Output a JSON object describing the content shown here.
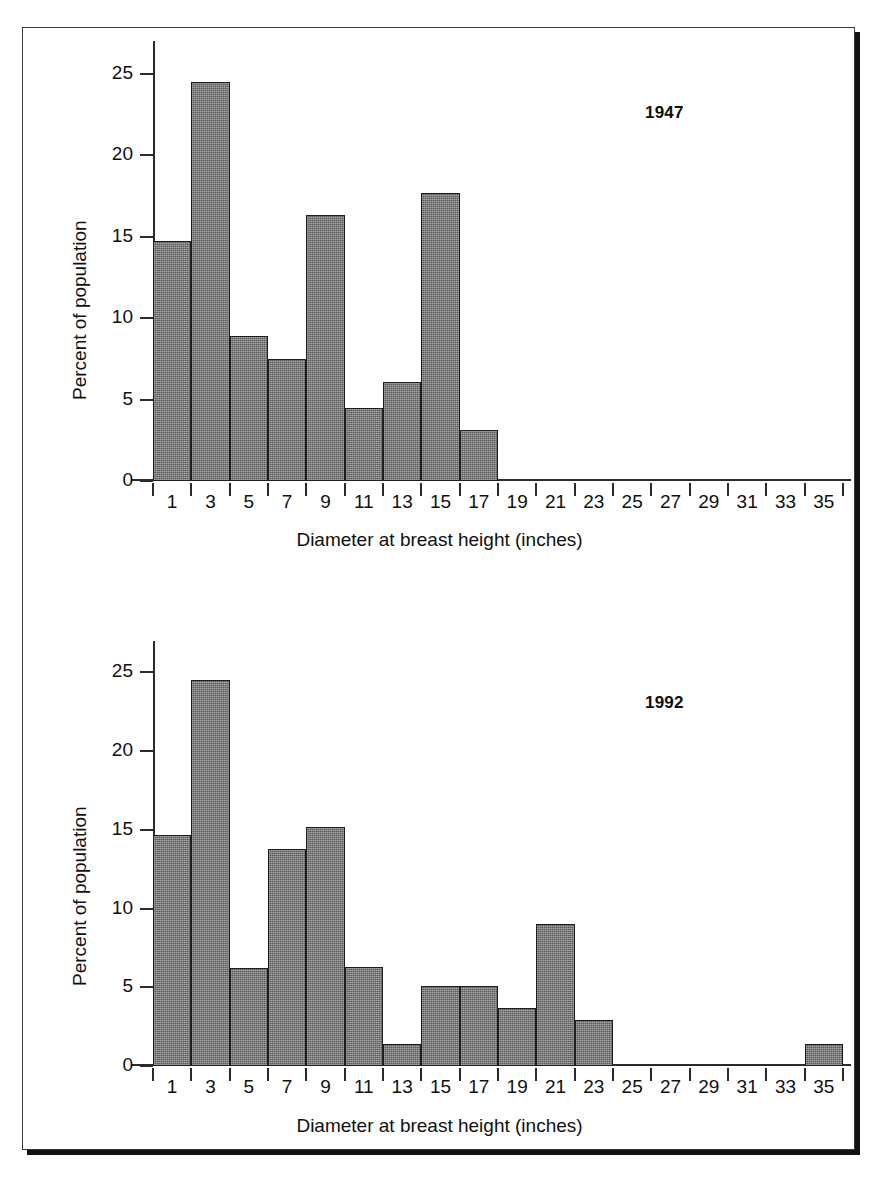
{
  "figure": {
    "x_axis_title": "Diameter at breast height (inches)",
    "y_axis_title": "Percent of population",
    "accent_color": "#6e6e6e",
    "outline_color": "#1d1d1d"
  },
  "panels": [
    {
      "id": "1947",
      "year_label": "1947"
    },
    {
      "id": "1992",
      "year_label": "1992"
    }
  ],
  "chart_data": [
    {
      "type": "bar",
      "title": "1947",
      "xlabel": "Diameter at breast height (inches)",
      "ylabel": "Percent of population",
      "xlim": [
        0,
        36
      ],
      "ylim": [
        0,
        27
      ],
      "ytick_labels": [
        "0",
        "5",
        "10",
        "15",
        "20",
        "25"
      ],
      "yticks": [
        0,
        5,
        10,
        15,
        20,
        25
      ],
      "xtick_labels": [
        "1",
        "3",
        "5",
        "7",
        "9",
        "11",
        "13",
        "15",
        "17",
        "19",
        "21",
        "23",
        "25",
        "27",
        "29",
        "31",
        "33",
        "35"
      ],
      "xticks": [
        1,
        3,
        5,
        7,
        9,
        11,
        13,
        15,
        17,
        19,
        21,
        23,
        25,
        27,
        29,
        31,
        33,
        35
      ],
      "bin_width": 2,
      "grid": false,
      "legend": "none",
      "categories": [
        1,
        3,
        5,
        7,
        9,
        11,
        13,
        15,
        17,
        19,
        21,
        23,
        25,
        27,
        29,
        31,
        33,
        35
      ],
      "values": [
        14.7,
        24.5,
        8.9,
        7.5,
        16.3,
        4.5,
        6.1,
        17.7,
        3.1,
        0,
        0,
        0,
        0,
        0,
        0,
        0,
        0,
        0
      ]
    },
    {
      "type": "bar",
      "title": "1992",
      "xlabel": "Diameter at breast height (inches)",
      "ylabel": "Percent of population",
      "xlim": [
        0,
        36
      ],
      "ylim": [
        0,
        27
      ],
      "ytick_labels": [
        "0",
        "5",
        "10",
        "15",
        "20",
        "25"
      ],
      "yticks": [
        0,
        5,
        10,
        15,
        20,
        25
      ],
      "xtick_labels": [
        "1",
        "3",
        "5",
        "7",
        "9",
        "11",
        "13",
        "15",
        "17",
        "19",
        "21",
        "23",
        "25",
        "27",
        "29",
        "31",
        "33",
        "35"
      ],
      "xticks": [
        1,
        3,
        5,
        7,
        9,
        11,
        13,
        15,
        17,
        19,
        21,
        23,
        25,
        27,
        29,
        31,
        33,
        35
      ],
      "bin_width": 2,
      "grid": false,
      "legend": "none",
      "categories": [
        1,
        3,
        5,
        7,
        9,
        11,
        13,
        15,
        17,
        19,
        21,
        23,
        25,
        27,
        29,
        31,
        33,
        35
      ],
      "values": [
        14.7,
        24.5,
        6.2,
        13.8,
        15.2,
        6.3,
        1.4,
        5.1,
        5.1,
        3.7,
        9.0,
        2.9,
        0,
        0,
        0,
        0,
        0,
        1.4
      ]
    }
  ]
}
